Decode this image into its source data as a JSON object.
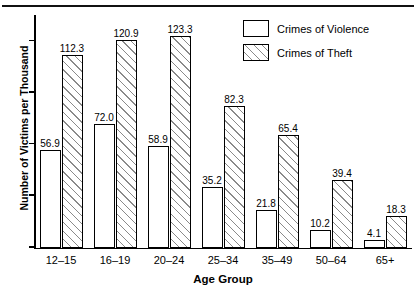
{
  "chart_data": {
    "type": "bar",
    "title": "",
    "xlabel": "Age Group",
    "ylabel": "Number of Victims per Thousand",
    "categories": [
      "12–15",
      "16–19",
      "20–24",
      "25–34",
      "35–49",
      "50–64",
      "65+"
    ],
    "series": [
      {
        "name": "Crimes of Violence",
        "values": [
          56.9,
          72.0,
          58.9,
          35.2,
          21.8,
          10.2,
          4.1
        ]
      },
      {
        "name": "Crimes of Theft",
        "values": [
          112.3,
          120.9,
          123.3,
          82.3,
          65.4,
          39.4,
          18.3
        ]
      }
    ],
    "ylim": [
      0,
      135
    ],
    "y_tick_values": [
      0,
      30,
      60,
      90,
      120
    ],
    "y_tick_labels_shown": false,
    "grid": false,
    "legend_position": "top-right",
    "value_labels_shown": true
  },
  "legend": {
    "items": [
      {
        "label": "Crimes of Violence",
        "swatch": "plain-white-box"
      },
      {
        "label": "Crimes of Theft",
        "swatch": "diagonal-hatched-box"
      }
    ]
  },
  "axes": {
    "y_title": "Number of Victims per Thousand",
    "x_title": "Age Group"
  },
  "colors": {
    "ink": "#000000",
    "hatch": "#8a8a8a",
    "background": "#ffffff"
  }
}
